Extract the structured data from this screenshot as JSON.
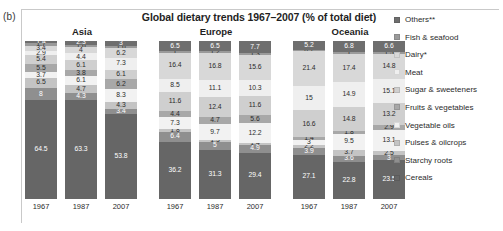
{
  "panel_letter": "(b)",
  "title": "Global dietary trends 1967–2007 (% of total diet)",
  "legend": {
    "items": [
      {
        "label": "Others**",
        "color": "#6e6e6e"
      },
      {
        "label": "Fish & seafood",
        "color": "#9a9a9a"
      },
      {
        "label": "Dairy*",
        "color": "#d8d8d8"
      },
      {
        "label": "Meat",
        "color": "#efefef"
      },
      {
        "label": "Sugar & sweeteners",
        "color": "#cfcfcf"
      },
      {
        "label": "Fruits & vegetables",
        "color": "#a8a8a8"
      },
      {
        "label": "Vegetable oils",
        "color": "#f2f2f2"
      },
      {
        "label": "Pulses & oilcrops",
        "color": "#c4c4c4"
      },
      {
        "label": "Starchy roots",
        "color": "#8f8f8f"
      },
      {
        "label": "Cereals",
        "color": "#666666"
      }
    ]
  },
  "chart_data": {
    "type": "bar",
    "subtype": "stacked-100",
    "title": "Global dietary trends 1967–2007 (% of total diet)",
    "xlabel": "",
    "ylabel": "",
    "ylim": [
      0,
      100
    ],
    "grid": false,
    "legend_position": "right",
    "categories": [
      "1967",
      "1987",
      "2007"
    ],
    "groups": [
      "Asia",
      "Europe",
      "Oceania"
    ],
    "series_order": [
      "Cereals",
      "Starchy roots",
      "Pulses & oilcrops",
      "Vegetable oils",
      "Fruits & vegetables",
      "Sugar & sweeteners",
      "Meat",
      "Dairy*",
      "Fish & seafood",
      "Others**"
    ],
    "regions": [
      {
        "name": "Asia",
        "years": [
          {
            "year": "1967",
            "values": {
              "Cereals": 64.5,
              "Starchy roots": 8.0,
              "Pulses & oilcrops": 6.5,
              "Vegetable oils": 3.7,
              "Fruits & vegetables": 5.5,
              "Sugar & sweeteners": 5.4,
              "Meat": 2.9,
              "Dairy*": 3.4,
              "Fish & seafood": 1.7,
              "Others**": 1.4
            }
          },
          {
            "year": "1987",
            "values": {
              "Cereals": 63.3,
              "Starchy roots": 4.3,
              "Pulses & oilcrops": 4.7,
              "Vegetable oils": 6.1,
              "Fruits & vegetables": 3.8,
              "Sugar & sweeteners": 6.1,
              "Meat": 4.4,
              "Dairy*": 4.0,
              "Fish & seafood": 1.6,
              "Others**": 2.3
            }
          },
          {
            "year": "2007",
            "values": {
              "Cereals": 53.8,
              "Starchy roots": 3.4,
              "Pulses & oilcrops": 4.3,
              "Vegetable oils": 8.3,
              "Fruits & vegetables": 6.2,
              "Sugar & sweeteners": 6.1,
              "Meat": 7.3,
              "Dairy*": 6.2,
              "Fish & seafood": 1.6,
              "Others**": 3.0
            }
          }
        ]
      },
      {
        "name": "Europe",
        "years": [
          {
            "year": "1967",
            "values": {
              "Cereals": 36.2,
              "Starchy roots": 6.4,
              "Pulses & oilcrops": 1.8,
              "Vegetable oils": 7.3,
              "Fruits & vegetables": 4.4,
              "Sugar & sweeteners": 11.6,
              "Meat": 8.5,
              "Dairy*": 16.4,
              "Fish & seafood": 1.0,
              "Others**": 6.5
            }
          },
          {
            "year": "1987",
            "values": {
              "Cereals": 31.3,
              "Starchy roots": 5.0,
              "Pulses & oilcrops": 1.3,
              "Vegetable oils": 9.7,
              "Fruits & vegetables": 4.7,
              "Sugar & sweeteners": 12.4,
              "Meat": 11.1,
              "Dairy*": 16.8,
              "Fish & seafood": 1.2,
              "Others**": 6.5
            }
          },
          {
            "year": "2007",
            "values": {
              "Cereals": 29.4,
              "Starchy roots": 4.9,
              "Pulses & oilcrops": 1.4,
              "Vegetable oils": 12.2,
              "Fruits & vegetables": 5.6,
              "Sugar & sweeteners": 11.6,
              "Meat": 10.3,
              "Dairy*": 15.6,
              "Fish & seafood": 1.3,
              "Others**": 7.7
            }
          }
        ]
      },
      {
        "name": "Oceania",
        "years": [
          {
            "year": "1967",
            "values": {
              "Cereals": 27.1,
              "Starchy roots": 3.9,
              "Pulses & oilcrops": 2.2,
              "Vegetable oils": 3.0,
              "Fruits & vegetables": 1.4,
              "Sugar & sweeteners": 16.6,
              "Meat": 15.0,
              "Dairy*": 21.4,
              "Fish & seafood": 0.7,
              "Others**": 5.2
            }
          },
          {
            "year": "1987",
            "values": {
              "Cereals": 22.8,
              "Starchy roots": 3.6,
              "Pulses & oilcrops": 3.7,
              "Vegetable oils": 9.5,
              "Fruits & vegetables": 1.8,
              "Sugar & sweeteners": 14.8,
              "Meat": 14.9,
              "Dairy*": 17.4,
              "Fish & seafood": 1.0,
              "Others**": 6.8
            }
          },
          {
            "year": "2007",
            "values": {
              "Cereals": 23.5,
              "Starchy roots": 3.0,
              "Pulses & oilcrops": 2.5,
              "Vegetable oils": 13.1,
              "Fruits & vegetables": 2.9,
              "Sugar & sweeteners": 13.2,
              "Meat": 15.1,
              "Dairy*": 14.8,
              "Fish & seafood": 1.5,
              "Others**": 6.6
            }
          }
        ]
      }
    ]
  }
}
